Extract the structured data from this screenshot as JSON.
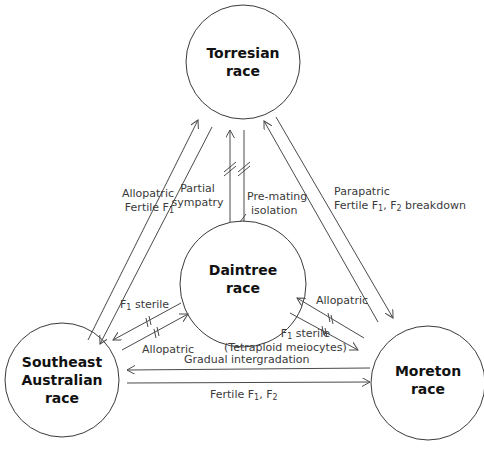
{
  "nodes": {
    "torresian": {
      "line1": "Torresian",
      "line2": "race"
    },
    "daintree": {
      "line1": "Daintree",
      "line2": "race"
    },
    "southeast": {
      "line1": "Southeast",
      "line2": "Australian",
      "line3": "race"
    },
    "moreton": {
      "line1": "Moreton",
      "line2": "race"
    }
  },
  "edges": {
    "torresian_southeast": {
      "line1": "Allopatric",
      "line2_prefix": "Fertile F",
      "line2_sub": "1"
    },
    "torresian_daintree_left": {
      "line1": "Partial",
      "line2": "sympatry"
    },
    "torresian_daintree_right": {
      "line1": "Pre-mating",
      "line2": "isolation"
    },
    "torresian_moreton": {
      "line1": "Parapatric",
      "line2_prefix": "Fertile F",
      "line2_sub1": "1",
      "line2_mid": ", F",
      "line2_sub2": "2",
      "line2_suffix": " breakdown"
    },
    "daintree_southeast_top": {
      "prefix": "F",
      "sub": "1",
      "suffix": " sterile"
    },
    "daintree_southeast_bottom": {
      "text": "Allopatric"
    },
    "daintree_moreton_top": {
      "text": "Allopatric"
    },
    "daintree_moreton_bottom": {
      "prefix": "F",
      "sub": "1",
      "suffix": " sterile",
      "line2": "(Tetraploid meiocytes)"
    },
    "southeast_moreton_top": {
      "text": "Gradual intergradation"
    },
    "southeast_moreton_bottom": {
      "prefix": "Fertile F",
      "sub1": "1",
      "mid": ", F",
      "sub2": "2"
    }
  },
  "colors": {
    "stroke": "#4a4a4a",
    "text": "#3a3a3a",
    "node_text": "#111111",
    "background": "#ffffff"
  }
}
